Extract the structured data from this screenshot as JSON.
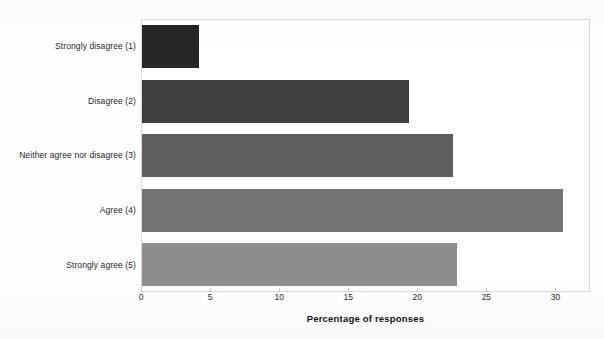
{
  "chart_data": {
    "type": "bar",
    "orientation": "horizontal",
    "title": "",
    "subtitle": "",
    "categories": [
      "Strongly disagree (1)",
      "Disagree (2)",
      "Neither agree nor disagree (3)",
      "Agree (4)",
      "Strongly agree (5)"
    ],
    "values": [
      4.1,
      19.3,
      22.5,
      30.5,
      22.8
    ],
    "xlabel": "Percentage of responses",
    "ylabel": "",
    "xlim": [
      0,
      32.5
    ],
    "xticks": [
      0,
      5,
      10,
      15,
      20,
      25,
      30
    ],
    "xtick_labels": [
      "0",
      "5",
      "10",
      "15",
      "20",
      "25",
      "30"
    ],
    "grid": false,
    "legend": null,
    "bar_colors": [
      "#262626",
      "#3f3f3f",
      "#5e5e5e",
      "#747474",
      "#8d8d8d"
    ],
    "plot_border_color": "#d9d9d9",
    "background_color": "#ffffff"
  },
  "figure": {
    "title_remnant": "Survey",
    "axis_title": "Percentage of responses"
  }
}
